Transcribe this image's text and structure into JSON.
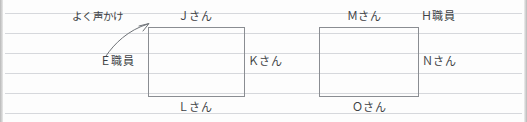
{
  "diagram": {
    "type": "handwritten-relationship-seating-sketch",
    "background": "ruled-notebook-paper",
    "rule_line_color": "#d6d8dc",
    "box_border_color": "#8a8d92",
    "text_color": "#3c3f44",
    "rule_lines_y": [
      13,
      33,
      53,
      73,
      93,
      113
    ],
    "boxes": [
      {
        "id": "left-table",
        "x": 148,
        "y": 27,
        "width": 97,
        "height": 70
      },
      {
        "id": "right-table",
        "x": 319,
        "y": 27,
        "width": 100,
        "height": 70
      }
    ],
    "annotation": {
      "text": "よく声かけ",
      "arrow": "curved-arrow-pointing-upper-right"
    },
    "labels": {
      "j": "Ｊさん",
      "m": "Ｍさん",
      "h": "Ｈ職員",
      "e": "Ｅ職員",
      "k": "Ｋさん",
      "n": "Ｎさん",
      "l": "Ｌさん",
      "o": "Ｏさん"
    }
  }
}
